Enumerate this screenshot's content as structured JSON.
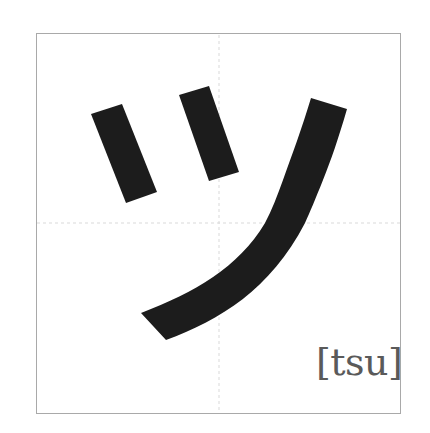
{
  "card": {
    "character": "ツ",
    "script": "katakana",
    "romaji_label": "[tsu]",
    "stroke_count": 3
  },
  "colors": {
    "background": "#ffffff",
    "border": "#a9a9a9",
    "guide_lines": "#d9d9d9",
    "stroke_fill": "#1c1c1c",
    "label_text": "#5a5a5a"
  }
}
